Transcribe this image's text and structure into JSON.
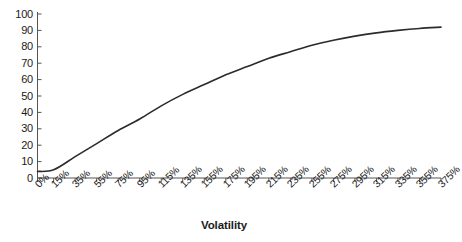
{
  "chart_data": {
    "type": "line",
    "title": "",
    "xlabel": "Volatility",
    "ylabel": "",
    "grid": false,
    "legend": false,
    "legend_position": "none",
    "line_color": "#2b2b2b",
    "background_color": "#ffffff",
    "axis_color": "#555555",
    "ylim": [
      0,
      100
    ],
    "yticks": [
      0,
      10,
      20,
      30,
      40,
      50,
      60,
      70,
      80,
      90,
      100
    ],
    "ytick_labels": [
      "0",
      "10",
      "20",
      "30",
      "40",
      "50",
      "60",
      "70",
      "80",
      "90",
      "100"
    ],
    "categories": [
      "0%",
      "15%",
      "35%",
      "55%",
      "75%",
      "95%",
      "115%",
      "135%",
      "155%",
      "175%",
      "195%",
      "215%",
      "235%",
      "255%",
      "275%",
      "295%",
      "315%",
      "335%",
      "355%",
      "375%"
    ],
    "x_numeric": [
      0,
      15,
      35,
      55,
      75,
      95,
      115,
      135,
      155,
      175,
      195,
      215,
      235,
      255,
      275,
      295,
      315,
      335,
      355,
      375
    ],
    "series": [
      {
        "name": "value",
        "values": [
          4,
          5,
          13,
          21,
          29,
          36,
          44,
          51,
          57,
          63,
          68,
          73,
          77,
          81,
          84,
          86.5,
          88.5,
          90,
          91.2,
          92
        ]
      }
    ]
  }
}
